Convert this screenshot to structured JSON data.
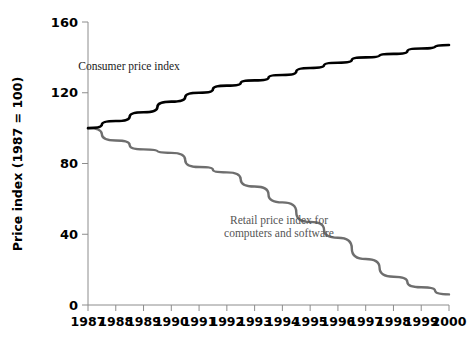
{
  "chart_data": {
    "type": "line",
    "title": "",
    "xlabel": "",
    "ylabel": "Price index (1987 = 100)",
    "xlim": [
      1987,
      2000
    ],
    "ylim": [
      0,
      160
    ],
    "yticks": [
      0,
      40,
      80,
      120,
      160
    ],
    "grid": false,
    "legend_position": "inline-annotations",
    "x": [
      1987,
      1988,
      1989,
      1990,
      1991,
      1992,
      1993,
      1994,
      1995,
      1996,
      1997,
      1998,
      1999,
      2000
    ],
    "series": [
      {
        "name": "Consumer price index",
        "color": "#000000",
        "values": [
          100,
          104,
          109,
          115,
          120,
          124,
          127,
          130,
          134,
          137,
          140,
          142,
          145,
          147
        ]
      },
      {
        "name": "Retail price index for computers and software",
        "color": "#6e6e6e",
        "values": [
          100,
          93,
          88,
          86,
          78,
          75,
          67,
          58,
          47,
          38,
          26,
          16,
          10,
          6
        ]
      }
    ],
    "annotations": [
      {
        "id": "cpi-annotation",
        "lines": [
          "Consumer price index"
        ],
        "x_px": 129,
        "y_px": 70,
        "color": "#1a1a1a"
      },
      {
        "id": "computer-index-annotation",
        "lines": [
          "Retail price index for",
          "computers and software"
        ],
        "x_px": 279,
        "y_px": 224,
        "color": "#555555"
      }
    ]
  },
  "axis": {
    "y_tick_labels": [
      "160",
      "120",
      "80",
      "40",
      "0"
    ],
    "x_tick_labels": [
      "1987",
      "1988",
      "1989",
      "1990",
      "1991",
      "1992",
      "1993",
      "1994",
      "1995",
      "1996",
      "1997",
      "1998",
      "1999",
      "2000"
    ],
    "y_axis_title": "Price index (1987 = 100)"
  },
  "colors": {
    "cpi_line": "#000000",
    "computer_line": "#6e6e6e",
    "axis": "#8c8c8c",
    "background": "#ffffff"
  }
}
